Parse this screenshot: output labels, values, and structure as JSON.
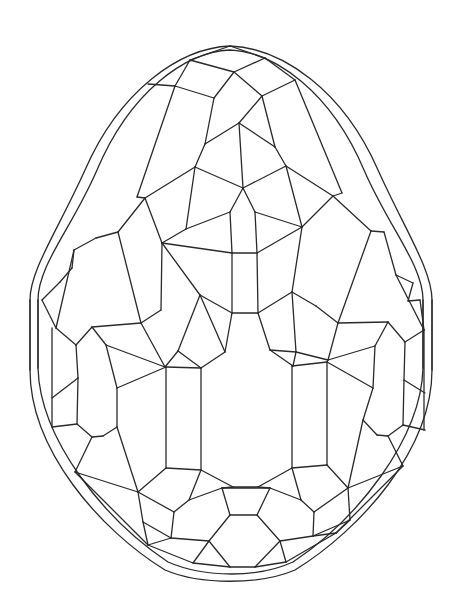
{
  "figure": {
    "background": "#ffffff",
    "stroke_color": "#2a2a2a",
    "outline": "M230,46 C180,48 120,90 85,170 C58,230 30,270 30,300 L30,370 C30,450 100,530 165,570 C200,585 260,585 295,570 C360,530 432,450 432,370 L432,300 C432,270 405,230 378,170 C343,90 282,48 230,46 Z",
    "inner_outline": "M230,50 C185,52 130,92 97,170 C72,228 38,265 38,300 L38,368 C40,440 105,520 168,562 C205,578 258,578 293,562 C356,520 421,440 423,368 L423,300 C423,265 389,228 364,170 C331,92 275,52 230,50 Z",
    "vertices": {
      "t0": [
        230,
        46
      ],
      "t1": [
        265,
        58
      ],
      "t2": [
        190,
        60
      ],
      "t3": [
        234,
        72
      ],
      "t4": [
        175,
        86
      ],
      "t5": [
        262,
        96
      ],
      "t6": [
        214,
        98
      ],
      "t7": [
        295,
        80
      ],
      "t8": [
        148,
        84
      ],
      "t9": [
        239,
        123
      ],
      "t10": [
        205,
        144
      ],
      "t11": [
        275,
        147
      ],
      "t12": [
        195,
        167
      ],
      "t13": [
        243,
        188
      ],
      "t14": [
        286,
        166
      ],
      "t15": [
        145,
        198
      ],
      "t16": [
        333,
        196
      ],
      "t17": [
        137,
        197
      ],
      "t18": [
        342,
        193
      ],
      "t19": [
        162,
        243
      ],
      "t20": [
        232,
        253
      ],
      "t21": [
        257,
        253
      ],
      "t22": [
        186,
        229
      ],
      "t23": [
        302,
        227
      ],
      "t24": [
        230,
        212
      ],
      "t25": [
        255,
        212
      ],
      "m0": [
        200,
        295
      ],
      "m1": [
        232,
        313
      ],
      "m2": [
        258,
        313
      ],
      "m3": [
        292,
        292
      ],
      "m4": [
        161,
        310
      ],
      "m5": [
        316,
        306
      ],
      "m6": [
        141,
        323
      ],
      "m7": [
        338,
        323
      ],
      "m8": [
        178,
        351
      ],
      "m9": [
        225,
        352
      ],
      "m10": [
        270,
        350
      ],
      "m11": [
        296,
        352
      ],
      "m12": [
        165,
        367
      ],
      "m13": [
        201,
        368
      ],
      "m14": [
        293,
        366
      ],
      "m15": [
        328,
        360
      ],
      "l0": [
        92,
        327
      ],
      "l1": [
        76,
        345
      ],
      "l2": [
        106,
        345
      ],
      "l3": [
        78,
        378
      ],
      "l4": [
        117,
        388
      ],
      "l5": [
        77,
        424
      ],
      "l6": [
        92,
        437
      ],
      "l7": [
        103,
        436
      ],
      "l8": [
        117,
        427
      ],
      "l9": [
        52,
        427
      ],
      "l10": [
        52,
        398
      ],
      "l11": [
        56,
        328
      ],
      "r0": [
        388,
        322
      ],
      "r1": [
        405,
        342
      ],
      "r2": [
        375,
        346
      ],
      "r3": [
        404,
        380
      ],
      "r4": [
        373,
        388
      ],
      "r5": [
        403,
        425
      ],
      "r6": [
        388,
        436
      ],
      "r7": [
        377,
        435
      ],
      "r8": [
        363,
        420
      ],
      "r9": [
        425,
        430
      ],
      "r10": [
        425,
        393
      ],
      "r11": [
        424,
        330
      ],
      "c0": [
        166,
        468
      ],
      "c1": [
        201,
        470
      ],
      "c2": [
        233,
        487
      ],
      "c3": [
        258,
        487
      ],
      "c4": [
        292,
        468
      ],
      "c5": [
        327,
        465
      ],
      "c6": [
        166,
        367
      ],
      "c7": [
        201,
        368
      ],
      "c8": [
        292,
        366
      ],
      "c9": [
        327,
        362
      ],
      "b0": [
        75,
        472
      ],
      "b1": [
        138,
        492
      ],
      "b2": [
        174,
        512
      ],
      "b3": [
        189,
        500
      ],
      "b4": [
        222,
        488
      ],
      "b5": [
        230,
        515
      ],
      "b6": [
        257,
        515
      ],
      "b7": [
        270,
        488
      ],
      "b8": [
        301,
        500
      ],
      "b9": [
        314,
        512
      ],
      "b10": [
        348,
        488
      ],
      "b11": [
        403,
        466
      ],
      "b12": [
        148,
        545
      ],
      "b13": [
        171,
        538
      ],
      "b14": [
        209,
        541
      ],
      "b15": [
        280,
        541
      ],
      "b16": [
        313,
        536
      ],
      "b17": [
        336,
        533
      ],
      "b18": [
        193,
        563
      ],
      "b19": [
        230,
        567
      ],
      "b20": [
        255,
        567
      ],
      "b21": [
        286,
        562
      ],
      "b22": [
        143,
        522
      ],
      "b23": [
        350,
        520
      ],
      "e0": [
        118,
        232
      ],
      "e1": [
        96,
        238
      ],
      "e2": [
        74,
        250
      ],
      "e3": [
        72,
        268
      ],
      "e4": [
        60,
        282
      ],
      "e5": [
        42,
        300
      ],
      "e6": [
        384,
        232
      ],
      "e7": [
        371,
        231
      ],
      "e8": [
        396,
        275
      ],
      "e9": [
        408,
        301
      ],
      "e10": [
        420,
        300
      ],
      "e11": [
        413,
        283
      ]
    },
    "edges": [
      [
        "t0",
        "t1"
      ],
      [
        "t0",
        "t2"
      ],
      [
        "t2",
        "t3"
      ],
      [
        "t1",
        "t3"
      ],
      [
        "t2",
        "t4"
      ],
      [
        "t4",
        "t8"
      ],
      [
        "t3",
        "t5"
      ],
      [
        "t3",
        "t6"
      ],
      [
        "t1",
        "t7"
      ],
      [
        "t5",
        "t7"
      ],
      [
        "t6",
        "t4"
      ],
      [
        "t6",
        "t10"
      ],
      [
        "t5",
        "t9"
      ],
      [
        "t9",
        "t10"
      ],
      [
        "t5",
        "t11"
      ],
      [
        "t9",
        "t11"
      ],
      [
        "t9",
        "t13"
      ],
      [
        "t10",
        "t12"
      ],
      [
        "t11",
        "t14"
      ],
      [
        "t12",
        "t13"
      ],
      [
        "t13",
        "t14"
      ],
      [
        "t12",
        "t15"
      ],
      [
        "t14",
        "t16"
      ],
      [
        "t4",
        "t17"
      ],
      [
        "t7",
        "t18"
      ],
      [
        "t17",
        "t15"
      ],
      [
        "t18",
        "t16"
      ],
      [
        "t12",
        "t22"
      ],
      [
        "t14",
        "t23"
      ],
      [
        "t13",
        "t24"
      ],
      [
        "t13",
        "t25"
      ],
      [
        "t22",
        "t24"
      ],
      [
        "t23",
        "t25"
      ],
      [
        "t24",
        "t20"
      ],
      [
        "t25",
        "t21"
      ],
      [
        "t20",
        "t21"
      ],
      [
        "t22",
        "t19"
      ],
      [
        "t19",
        "t20"
      ],
      [
        "t23",
        "t21"
      ],
      [
        "t15",
        "t19"
      ],
      [
        "t16",
        "t23"
      ],
      [
        "t20",
        "m1"
      ],
      [
        "t21",
        "m2"
      ],
      [
        "t19",
        "m0"
      ],
      [
        "m0",
        "m1"
      ],
      [
        "m1",
        "m2"
      ],
      [
        "m2",
        "m3"
      ],
      [
        "t23",
        "m3"
      ],
      [
        "t19",
        "m4"
      ],
      [
        "m3",
        "m5"
      ],
      [
        "m4",
        "m6"
      ],
      [
        "m5",
        "m7"
      ],
      [
        "m0",
        "m8"
      ],
      [
        "m0",
        "m9"
      ],
      [
        "m9",
        "m1"
      ],
      [
        "m2",
        "m10"
      ],
      [
        "m3",
        "m11"
      ],
      [
        "m10",
        "m11"
      ],
      [
        "m8",
        "m12"
      ],
      [
        "m9",
        "m13"
      ],
      [
        "m10",
        "m14"
      ],
      [
        "m11",
        "m15"
      ],
      [
        "m8",
        "m13"
      ],
      [
        "m11",
        "m14"
      ],
      [
        "m6",
        "m12"
      ],
      [
        "m7",
        "m15"
      ],
      [
        "t15",
        "e0"
      ],
      [
        "e0",
        "m6"
      ],
      [
        "t16",
        "e7"
      ],
      [
        "e7",
        "m7"
      ],
      [
        "e0",
        "e1"
      ],
      [
        "e1",
        "e2"
      ],
      [
        "e2",
        "e3"
      ],
      [
        "e3",
        "e4"
      ],
      [
        "e4",
        "e5"
      ],
      [
        "e7",
        "e6"
      ],
      [
        "e6",
        "e8"
      ],
      [
        "e8",
        "e11"
      ],
      [
        "e11",
        "e9"
      ],
      [
        "e9",
        "e10"
      ],
      [
        "m6",
        "l0"
      ],
      [
        "l0",
        "l1"
      ],
      [
        "l0",
        "l2"
      ],
      [
        "l1",
        "l3"
      ],
      [
        "l2",
        "l4"
      ],
      [
        "l3",
        "l5"
      ],
      [
        "l4",
        "l8"
      ],
      [
        "l5",
        "l6"
      ],
      [
        "l6",
        "l7"
      ],
      [
        "l7",
        "l8"
      ],
      [
        "l2",
        "m12"
      ],
      [
        "l1",
        "l11"
      ],
      [
        "l11",
        "e5"
      ],
      [
        "l3",
        "l10"
      ],
      [
        "l5",
        "l9"
      ],
      [
        "l4",
        "c6"
      ],
      [
        "e2",
        "l11"
      ],
      [
        "m7",
        "r0"
      ],
      [
        "r0",
        "r1"
      ],
      [
        "r0",
        "r2"
      ],
      [
        "r1",
        "r3"
      ],
      [
        "r2",
        "r4"
      ],
      [
        "r3",
        "r5"
      ],
      [
        "r4",
        "r8"
      ],
      [
        "r5",
        "r6"
      ],
      [
        "r6",
        "r7"
      ],
      [
        "r7",
        "r8"
      ],
      [
        "r2",
        "m15"
      ],
      [
        "r1",
        "r11"
      ],
      [
        "r11",
        "e10"
      ],
      [
        "r3",
        "r10"
      ],
      [
        "r5",
        "r9"
      ],
      [
        "r4",
        "c9"
      ],
      [
        "e8",
        "r11"
      ],
      [
        "c6",
        "c0"
      ],
      [
        "c7",
        "c1"
      ],
      [
        "c8",
        "c4"
      ],
      [
        "c9",
        "c5"
      ],
      [
        "c6",
        "c7"
      ],
      [
        "c8",
        "c9"
      ],
      [
        "c0",
        "c1"
      ],
      [
        "c4",
        "c5"
      ],
      [
        "m12",
        "c6"
      ],
      [
        "m13",
        "c7"
      ],
      [
        "m14",
        "c8"
      ],
      [
        "m15",
        "c9"
      ],
      [
        "c1",
        "c2"
      ],
      [
        "c2",
        "c3"
      ],
      [
        "c3",
        "c4"
      ],
      [
        "c0",
        "b1"
      ],
      [
        "c5",
        "b10"
      ],
      [
        "c1",
        "b3"
      ],
      [
        "c4",
        "b8"
      ],
      [
        "b3",
        "b4"
      ],
      [
        "b4",
        "b7"
      ],
      [
        "b7",
        "b8"
      ],
      [
        "c2",
        "b4"
      ],
      [
        "c3",
        "b7"
      ],
      [
        "b4",
        "b5"
      ],
      [
        "b7",
        "b6"
      ],
      [
        "b5",
        "b6"
      ],
      [
        "b3",
        "b2"
      ],
      [
        "b8",
        "b9"
      ],
      [
        "b1",
        "b2"
      ],
      [
        "b9",
        "b10"
      ],
      [
        "l8",
        "b1"
      ],
      [
        "l6",
        "b0"
      ],
      [
        "b0",
        "b1"
      ],
      [
        "r8",
        "b10"
      ],
      [
        "r6",
        "b11"
      ],
      [
        "b11",
        "b10"
      ],
      [
        "b2",
        "b13"
      ],
      [
        "b9",
        "b16"
      ],
      [
        "b5",
        "b14"
      ],
      [
        "b6",
        "b15"
      ],
      [
        "b13",
        "b14"
      ],
      [
        "b15",
        "b16"
      ],
      [
        "b1",
        "b22"
      ],
      [
        "b10",
        "b23"
      ],
      [
        "b22",
        "b13"
      ],
      [
        "b23",
        "b16"
      ],
      [
        "b22",
        "b12"
      ],
      [
        "b23",
        "b17"
      ],
      [
        "b12",
        "b13"
      ],
      [
        "b17",
        "b16"
      ],
      [
        "b14",
        "b18"
      ],
      [
        "b15",
        "b21"
      ],
      [
        "b18",
        "b19"
      ],
      [
        "b19",
        "b20"
      ],
      [
        "b20",
        "b21"
      ],
      [
        "b12",
        "b18"
      ],
      [
        "b17",
        "b21"
      ],
      [
        "b0",
        "b12"
      ],
      [
        "b11",
        "b17"
      ],
      [
        "b14",
        "b19"
      ],
      [
        "b15",
        "b20"
      ]
    ],
    "vertical_guides": [
      [
        [
          30,
          300
        ],
        [
          30,
          370
        ]
      ],
      [
        [
          38,
          300
        ],
        [
          38,
          368
        ]
      ],
      [
        [
          52,
          328
        ],
        [
          52,
          427
        ]
      ],
      [
        [
          432,
          300
        ],
        [
          432,
          370
        ]
      ],
      [
        [
          423,
          300
        ],
        [
          423,
          368
        ]
      ],
      [
        [
          424,
          330
        ],
        [
          424,
          430
        ]
      ]
    ]
  }
}
